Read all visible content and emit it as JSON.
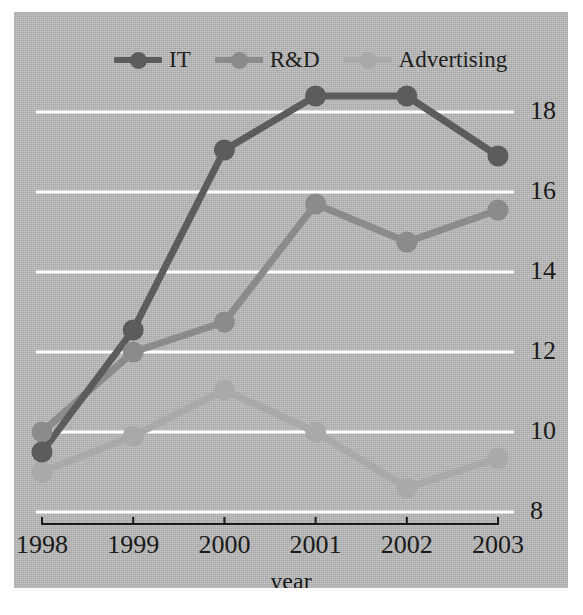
{
  "chart_data": {
    "type": "line",
    "title": "",
    "xlabel": "year",
    "ylabel": "",
    "categories": [
      "1998",
      "1999",
      "2000",
      "2001",
      "2002",
      "2003"
    ],
    "x": [
      1998,
      1999,
      2000,
      2001,
      2002,
      2003
    ],
    "series": [
      {
        "name": "IT",
        "color": "#5c5c5c",
        "values": [
          9.5,
          12.55,
          17.05,
          18.4,
          18.4,
          16.9
        ]
      },
      {
        "name": "R&D",
        "color": "#8b8b8b",
        "values": [
          10.0,
          12.0,
          12.75,
          15.7,
          14.75,
          15.55
        ]
      },
      {
        "name": "Advertising",
        "color": "#a9a9a9",
        "values": [
          9.0,
          9.9,
          11.05,
          10.0,
          8.6,
          9.35
        ]
      }
    ],
    "ylim": [
      8,
      18.9
    ],
    "yticks": [
      8,
      10,
      12,
      14,
      16,
      18
    ],
    "ytick_labels": [
      "8",
      "10",
      "12",
      "14",
      "16",
      "18"
    ],
    "grid": true,
    "gridline_color": "#ffffff",
    "legend_position": "top-center",
    "axis_side": "right",
    "plot_background": "#b4b4b4",
    "figure_background": "#ffffff",
    "axis_line_color": "#1a1a1a"
  },
  "legend": {
    "entries": [
      {
        "label": "IT"
      },
      {
        "label": "R&D"
      },
      {
        "label": "Advertising"
      }
    ]
  },
  "axes": {
    "x_title": "year",
    "x_labels": [
      "1998",
      "1999",
      "2000",
      "2001",
      "2002",
      "2003"
    ],
    "y_labels": [
      "18",
      "16",
      "14",
      "12",
      "10",
      "8"
    ]
  }
}
